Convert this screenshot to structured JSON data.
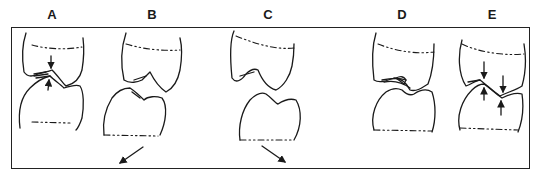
{
  "figure": {
    "type": "dental occlusion line diagram",
    "frame_color": "#222222",
    "stroke_color": "#1a1a1a",
    "background": "#ffffff"
  },
  "panels": [
    {
      "id": "A",
      "label": "A",
      "label_x": 52,
      "description": "Upper and lower molars in centric contact; vertical arrows pointing at cusp contact",
      "arrows": [
        "down-onto-contact",
        "up-onto-contact"
      ]
    },
    {
      "id": "B",
      "label": "B",
      "label_x": 152,
      "description": "Lower tooth displaced; diagonal arrow pointing down-left",
      "arrows": [
        "down-left"
      ]
    },
    {
      "id": "C",
      "label": "C",
      "label_x": 268,
      "description": "Lower tooth displaced; diagonal arrow pointing down-right",
      "arrows": [
        "down-right"
      ]
    },
    {
      "id": "D",
      "label": "D",
      "label_x": 402,
      "description": "Upper and lower molars in contact with interlocking cusps",
      "arrows": []
    },
    {
      "id": "E",
      "label": "E",
      "label_x": 492,
      "description": "Molars in contact with two pairs of opposing vertical arrows at cusp contacts",
      "arrows": [
        "down",
        "up",
        "down",
        "up"
      ]
    }
  ]
}
